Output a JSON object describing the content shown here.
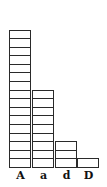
{
  "chart_data": {
    "type": "bar",
    "style": "stacked unit squares",
    "title": "",
    "xlabel": "",
    "ylabel": "",
    "categories": [
      "A",
      "a",
      "d",
      "D"
    ],
    "values": [
      16,
      9,
      3,
      1
    ],
    "ylim": [
      0,
      16
    ],
    "grid": false,
    "legend": null
  },
  "labels": [
    "A",
    "a",
    "d",
    "D"
  ]
}
